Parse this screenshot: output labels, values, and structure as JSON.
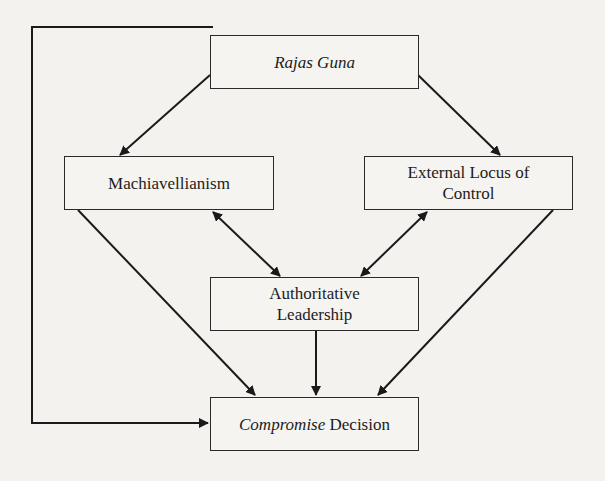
{
  "diagram": {
    "type": "flowchart",
    "background": "#f3f2ef",
    "line_color": "#1a1a1a",
    "nodes": {
      "rajas_guna": {
        "label": "Rajas Guna",
        "italic": true
      },
      "machiavellianism": {
        "label": "Machiavellianism"
      },
      "external_locus": {
        "line1": "External Locus of",
        "line2": "Control"
      },
      "authoritative": {
        "line1": "Authoritative",
        "line2": "Leadership"
      },
      "compromise": {
        "italic_part": "Compromise",
        "plain_part": " Decision"
      }
    },
    "edges": [
      {
        "from": "Rajas Guna",
        "to": "Machiavellianism",
        "type": "directed"
      },
      {
        "from": "Rajas Guna",
        "to": "External Locus of Control",
        "type": "directed"
      },
      {
        "from": "Rajas Guna",
        "to": "Compromise Decision",
        "type": "directed"
      },
      {
        "from": "Machiavellianism",
        "to": "Authoritative Leadership",
        "type": "bidirectional"
      },
      {
        "from": "External Locus of Control",
        "to": "Authoritative Leadership",
        "type": "bidirectional"
      },
      {
        "from": "Machiavellianism",
        "to": "Compromise Decision",
        "type": "directed"
      },
      {
        "from": "External Locus of Control",
        "to": "Compromise Decision",
        "type": "directed"
      },
      {
        "from": "Authoritative Leadership",
        "to": "Compromise Decision",
        "type": "directed"
      }
    ]
  }
}
